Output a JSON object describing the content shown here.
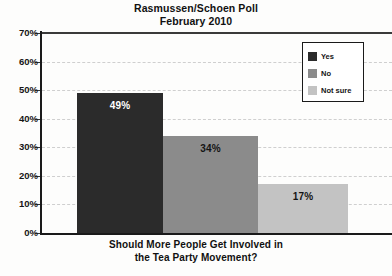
{
  "chart_data": {
    "type": "bar",
    "title": "Rasmussen/Schoen Poll",
    "subtitle": "February 2010",
    "caption_line1": "Should More People Get Involved in",
    "caption_line2": "the Tea Party Movement?",
    "xlabel": "",
    "ylabel": "",
    "ylim": [
      0,
      70
    ],
    "ytick_step": 10,
    "grid": true,
    "grid_style": "dashed-horizontal",
    "legend_position": "top-right",
    "categories": [
      "Yes",
      "No",
      "Not sure"
    ],
    "values": [
      49,
      34,
      17
    ],
    "value_labels": [
      "49%",
      "34%",
      "17%"
    ],
    "yticks": [
      "70%",
      "60%",
      "50%",
      "40%",
      "30%",
      "20%",
      "10%",
      "0%"
    ],
    "colors": [
      "#2b2b2b",
      "#8b8b8b",
      "#c3c3c3"
    ],
    "bars": [
      {
        "label": "Yes",
        "value": 49,
        "value_label": "49%",
        "color": "#2b2b2b",
        "label_color": "#ffffff"
      },
      {
        "label": "No",
        "value": 34,
        "value_label": "34%",
        "color": "#8b8b8b",
        "label_color": "#141414"
      },
      {
        "label": "Not sure",
        "value": 17,
        "value_label": "17%",
        "color": "#c3c3c3",
        "label_color": "#141414"
      }
    ],
    "legend": [
      {
        "label": "Yes",
        "color": "#2b2b2b"
      },
      {
        "label": "No",
        "color": "#8b8b8b"
      },
      {
        "label": "Not sure",
        "color": "#c3c3c3"
      }
    ]
  }
}
